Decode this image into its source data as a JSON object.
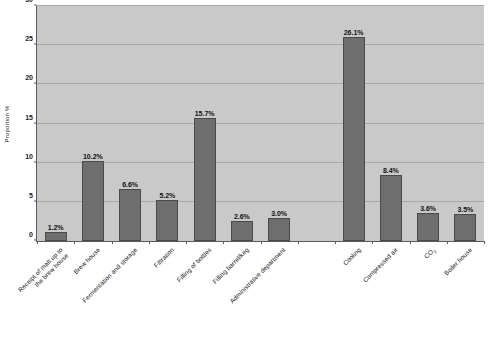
{
  "chart_data": {
    "type": "bar",
    "title": "",
    "xlabel": "",
    "ylabel": "Proportion %",
    "ylim": [
      0,
      30
    ],
    "yticks": [
      0,
      5,
      10,
      15,
      20,
      25,
      30
    ],
    "ytick_labels": [
      "0",
      "5",
      "10",
      "15",
      "20",
      "25",
      "30"
    ],
    "grid": true,
    "legend": "none",
    "bar_color": "#6e6e6e",
    "plot_background": "#c9c9c9",
    "gridline_color": "#a8a8a8",
    "axis_color": "#5a5a5a",
    "categories": [
      "Receipt of malt up to\nthe brew house",
      "Brew house",
      "Fermentation and storage",
      "Filtration",
      "Filling of bottles",
      "Filling barrel/keg",
      "Administrative department",
      "Cooling",
      "Compressed air",
      "CO2",
      "Boiler house"
    ],
    "values": [
      1.2,
      10.2,
      6.6,
      5.2,
      15.7,
      2.6,
      3.0,
      26.1,
      8.4,
      3.6,
      3.5
    ],
    "value_labels": [
      "1.2%",
      "10.2%",
      "6.6%",
      "5.2%",
      "15.7%",
      "2.6%",
      "3.0%",
      "26.1%",
      "8.4%",
      "3.6%",
      "3.5%"
    ]
  },
  "axis": {
    "y_title": "Proportion %"
  },
  "category_labels": [
    {
      "line1": "Receipt of malt up to",
      "line2": "the brew house"
    },
    {
      "line1": "Brew house",
      "line2": ""
    },
    {
      "line1": "Fermentation and storage",
      "line2": ""
    },
    {
      "line1": "Filtration",
      "line2": ""
    },
    {
      "line1": "Filling of bottles",
      "line2": ""
    },
    {
      "line1": "Filling barrel/keg",
      "line2": ""
    },
    {
      "line1": "Administrative department",
      "line2": ""
    },
    {
      "line1": "Cooling",
      "line2": ""
    },
    {
      "line1": "Compressed air",
      "line2": ""
    },
    {
      "line1": "CO",
      "line2": ""
    },
    {
      "line1": "Boiler house",
      "line2": ""
    }
  ],
  "co2_subscript": "2"
}
